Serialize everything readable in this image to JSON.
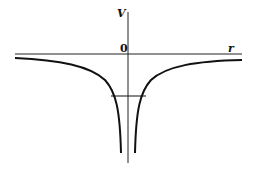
{
  "diagram": {
    "type": "potential-energy-plot",
    "y_axis_label": "V",
    "x_axis_label": "r",
    "origin_label": "0",
    "curve": "attractive 1/r potential, symmetric about V axis, diverging to -infinity at r=0",
    "energy_level_line": "horizontal segment intersecting both branches below the axis",
    "colors": {
      "ink": "#111111",
      "background": "#ffffff"
    }
  }
}
